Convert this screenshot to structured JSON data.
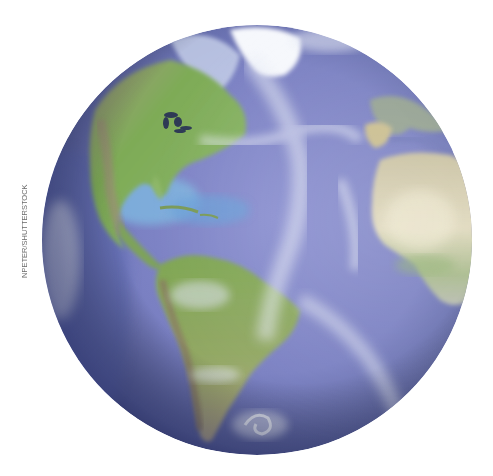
{
  "image": {
    "subject": "Earth globe showing the Americas, Atlantic Ocean and Africa",
    "credit": "NPETER/SHUTTERSTOCK"
  },
  "colors": {
    "background": "#ffffff",
    "ocean": "#7f84c6",
    "ocean_deep": "#4d5596",
    "ocean_shallow": "#7fb7e0",
    "land_green": "#7fa653",
    "land_desert": "#d6cfae",
    "cloud": "#e8ecf6",
    "ice": "#ffffff",
    "credit_text": "#6b6b6b"
  },
  "globe": {
    "center_x": 257,
    "center_y": 240,
    "radius": 215
  }
}
